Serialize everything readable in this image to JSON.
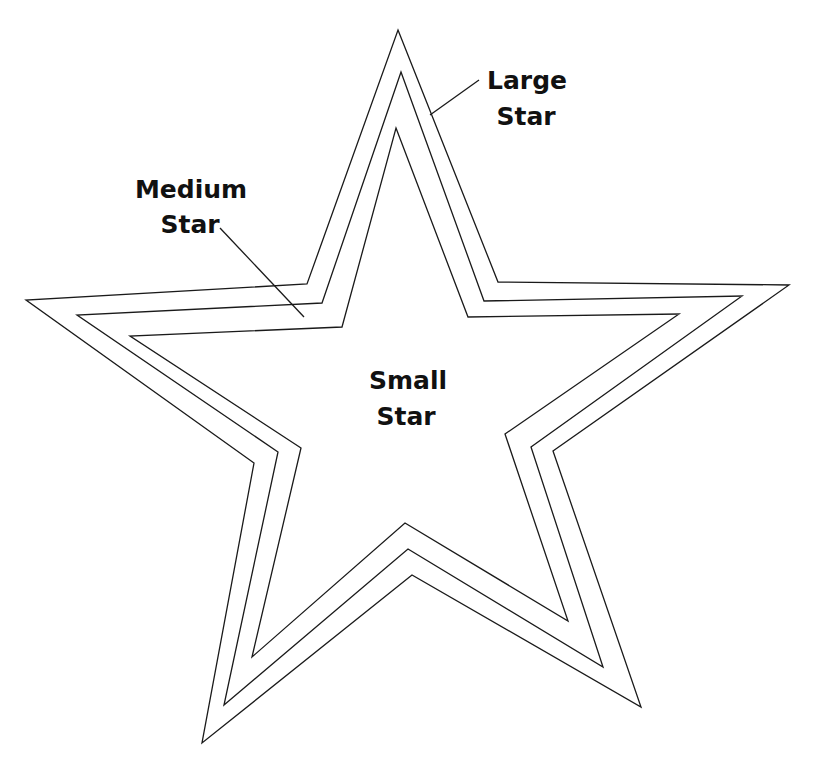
{
  "diagram": {
    "type": "concentric-stars",
    "stroke_color": "#1a1a1a",
    "background": "#ffffff",
    "stars": [
      {
        "id": "large",
        "name": "Large Star",
        "points": "398,30 498,282 789,285 553,451 641,707 412,575 202,743 254,463 26,300 307,284"
      },
      {
        "id": "medium",
        "name": "Medium Star",
        "points": "401,72 484,301 742,296 531,447 603,667 408,549 224,705 278,452 77,315 322,303"
      },
      {
        "id": "small",
        "name": "Small Star",
        "points": "396,128 468,317 679,314 505,434 568,621 405,523 252,657 301,448 130,336 342,327"
      }
    ],
    "labels": {
      "large": {
        "line1": "Large",
        "line2": "Star"
      },
      "medium": {
        "line1": "Medium",
        "line2": "Star"
      },
      "small": {
        "line1": "Small",
        "line2": "Star"
      }
    },
    "leaders": {
      "large": {
        "x1": 479,
        "y1": 80,
        "x2": 430,
        "y2": 115
      },
      "medium": {
        "x1": 220,
        "y1": 228,
        "x2": 304,
        "y2": 317
      }
    }
  }
}
